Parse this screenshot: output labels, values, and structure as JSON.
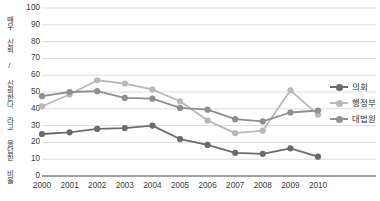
{
  "chart_data": {
    "type": "line",
    "title": "",
    "xlabel": "",
    "ylabel": "매우 신뢰 / 신뢰한다 라고 응답한 비율",
    "x": [
      "2000",
      "2001",
      "2002",
      "2003",
      "2004",
      "2005",
      "2006",
      "2007",
      "2008",
      "2009",
      "2010"
    ],
    "ylim": [
      0,
      100
    ],
    "ytick_labels": [
      "0",
      "10",
      "20",
      "30",
      "40",
      "50",
      "60",
      "70",
      "80",
      "90",
      "100"
    ],
    "grid": true,
    "legend_position": "right",
    "series": [
      {
        "name": "의회",
        "color": "#6b6b6b",
        "values": [
          25,
          26,
          28,
          28.5,
          30,
          22,
          18.5,
          13.8,
          13.2,
          16.5,
          11.5
        ]
      },
      {
        "name": "행정부",
        "color": "#b8b8b8",
        "values": [
          41.5,
          48.5,
          57,
          55,
          51.5,
          44.5,
          33,
          25.5,
          27,
          51,
          36.5
        ]
      },
      {
        "name": "대법원",
        "color": "#8f8f8f",
        "values": [
          47.5,
          50,
          50.5,
          46.5,
          46,
          40.5,
          39.5,
          33.8,
          32.5,
          37.8,
          39
        ]
      }
    ]
  },
  "axis": {
    "y_label_text": "매우 신뢰 / 신뢰한다 라고 응답한 비율"
  },
  "legend": {
    "items": [
      {
        "label": "의회",
        "color": "#6b6b6b"
      },
      {
        "label": "행정부",
        "color": "#b8b8b8"
      },
      {
        "label": "대법원",
        "color": "#8f8f8f"
      }
    ]
  },
  "style": {
    "grid_color": "#d9d9d9",
    "axis_color": "#808080",
    "background": "#ffffff"
  }
}
